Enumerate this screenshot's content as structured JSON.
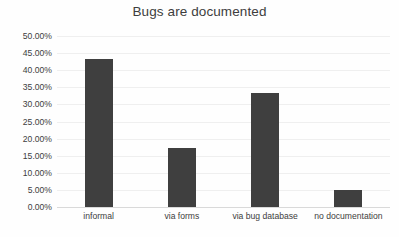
{
  "chart_data": {
    "type": "bar",
    "title": "Bugs are documented",
    "xlabel": "",
    "ylabel": "",
    "categories": [
      "informal",
      "via forms",
      "via bug database",
      "no documentation"
    ],
    "values": [
      43.3,
      17.3,
      33.3,
      4.9
    ],
    "value_labels": [
      "43.30%",
      "17.30%",
      "33.30%",
      "4.90%"
    ],
    "series": [
      {
        "name": "Bugs are documented",
        "values": [
          43.3,
          17.3,
          33.3,
          4.9
        ]
      }
    ],
    "ylim": [
      0,
      50
    ],
    "ytick_values": [
      0,
      5,
      10,
      15,
      20,
      25,
      30,
      35,
      40,
      45,
      50
    ],
    "ytick_labels": [
      "0.00%",
      "5.00%",
      "10.00%",
      "15.00%",
      "20.00%",
      "25.00%",
      "30.00%",
      "35.00%",
      "40.00%",
      "45.00%",
      "50.00%"
    ],
    "grid": true,
    "grid_axis": "y",
    "legend": false,
    "legend_position": "none",
    "bar_color": "#3f3f3f",
    "grid_color": "#efefef",
    "axis_color": "#d9d9d9",
    "text_color": "#3d3d3d",
    "background": "#fefefe"
  }
}
